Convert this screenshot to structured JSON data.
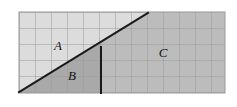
{
  "figure": {
    "background_color": "#ffffff",
    "plot_area": {
      "x": 19,
      "y": 12,
      "width": 206,
      "height": 81
    },
    "grid": {
      "visible": true,
      "cell_size": 16,
      "line_color": "#9a9a9a",
      "columns": 13,
      "rows": 5
    },
    "fills": {
      "region_a_color": "#dcdcdc",
      "region_b_color": "#a9a9a9",
      "region_c_color": "#bcbcbc"
    },
    "lines": {
      "color": "#1a1a1a",
      "width": 2,
      "diagonal": {
        "x1": 19,
        "y1": 92,
        "x2": 148,
        "y2": 13
      },
      "vertical": {
        "x": 101,
        "y1": 47,
        "y2": 93
      }
    },
    "labels": [
      {
        "id": "region-a",
        "text": "A",
        "x": 58,
        "y": 45
      },
      {
        "id": "region-b",
        "text": "B",
        "x": 72,
        "y": 75
      },
      {
        "id": "region-c",
        "text": "C",
        "x": 163,
        "y": 52
      }
    ]
  }
}
